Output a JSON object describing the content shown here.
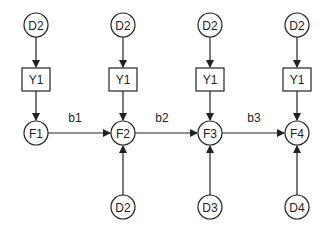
{
  "diagram": {
    "columns": [
      {
        "x": 36,
        "top": "D2",
        "box": "Y1",
        "mid": "F1",
        "bottom": null
      },
      {
        "x": 123,
        "top": "D2",
        "box": "Y1",
        "mid": "F2",
        "bottom": "D2"
      },
      {
        "x": 210,
        "top": "D2",
        "box": "Y1",
        "mid": "F3",
        "bottom": "D3"
      },
      {
        "x": 297,
        "top": "D2",
        "box": "Y1",
        "mid": "F4",
        "bottom": "D4"
      }
    ],
    "edge_labels": [
      "b1",
      "b2",
      "b3"
    ],
    "colors": {
      "stroke": "#222222",
      "background": "#ffffff"
    }
  }
}
